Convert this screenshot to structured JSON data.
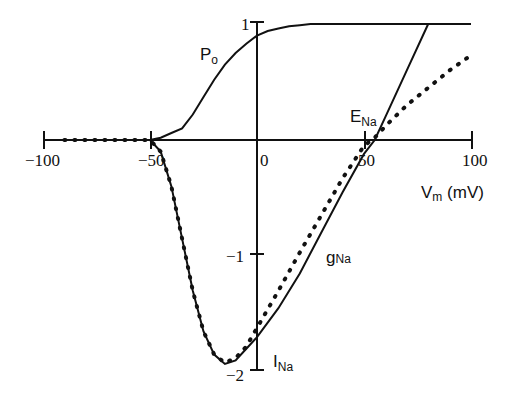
{
  "chart_data": {
    "type": "line",
    "title": "",
    "xlabel": "Vm (mV)",
    "ylabel": "",
    "xlim": [
      -100,
      100
    ],
    "ylim": [
      -2,
      1
    ],
    "grid": false,
    "xticks": [
      "-100",
      "-50",
      "0",
      "50",
      "100"
    ],
    "yticks": [
      "1",
      "-1",
      "-2"
    ],
    "annotations": [
      "Po",
      "ENa",
      "gNa",
      "INa"
    ],
    "series": [
      {
        "name": "Po",
        "style": "solid",
        "x": [
          -100,
          -50,
          -45,
          -40,
          -35,
          -30,
          -25,
          -20,
          -15,
          -10,
          -5,
          0,
          5,
          10,
          15,
          20,
          25,
          30,
          100
        ],
        "y": [
          0,
          0,
          0.02,
          0.06,
          0.1,
          0.22,
          0.37,
          0.52,
          0.65,
          0.75,
          0.83,
          0.9,
          0.94,
          0.96,
          0.98,
          0.99,
          1.0,
          1.0,
          1.0
        ]
      },
      {
        "name": "gNa",
        "style": "solid",
        "x": [
          -100,
          -50,
          -45,
          -40,
          -35,
          -30,
          -25,
          -20,
          -15,
          -10,
          -5,
          0,
          10,
          20,
          30,
          40,
          50,
          55,
          60,
          70,
          80
        ],
        "y": [
          0,
          0,
          -0.1,
          -0.4,
          -0.85,
          -1.3,
          -1.65,
          -1.85,
          -1.93,
          -1.9,
          -1.8,
          -1.7,
          -1.45,
          -1.15,
          -0.8,
          -0.45,
          -0.12,
          0,
          0.2,
          0.6,
          1.0
        ]
      },
      {
        "name": "INa",
        "style": "dotted",
        "x": [
          -90,
          -50,
          -45,
          -40,
          -35,
          -30,
          -25,
          -20,
          -15,
          -10,
          -5,
          0,
          10,
          20,
          30,
          40,
          50,
          55,
          60,
          70,
          80,
          90,
          100
        ],
        "y": [
          0,
          0,
          -0.1,
          -0.4,
          -0.85,
          -1.3,
          -1.65,
          -1.85,
          -1.92,
          -1.88,
          -1.78,
          -1.62,
          -1.3,
          -0.97,
          -0.65,
          -0.33,
          -0.05,
          0.02,
          0.12,
          0.3,
          0.45,
          0.6,
          0.73
        ]
      }
    ]
  },
  "labels": {
    "po_main": "P",
    "po_sub": "o",
    "ena_main": "E",
    "ena_sub": "Na",
    "gna_main": "g",
    "gna_sub": "Na",
    "ina_main": "I",
    "ina_sub": "Na",
    "xlabel_main": "V",
    "xlabel_sub": "m",
    "xlabel_unit": " (mV)",
    "xtick_m100": "−100",
    "xtick_m50": "−50",
    "xtick_0": "0",
    "xtick_50": "50",
    "xtick_100": "100",
    "ytick_1": "1",
    "ytick_m1": "−1",
    "ytick_m2": "−2"
  }
}
